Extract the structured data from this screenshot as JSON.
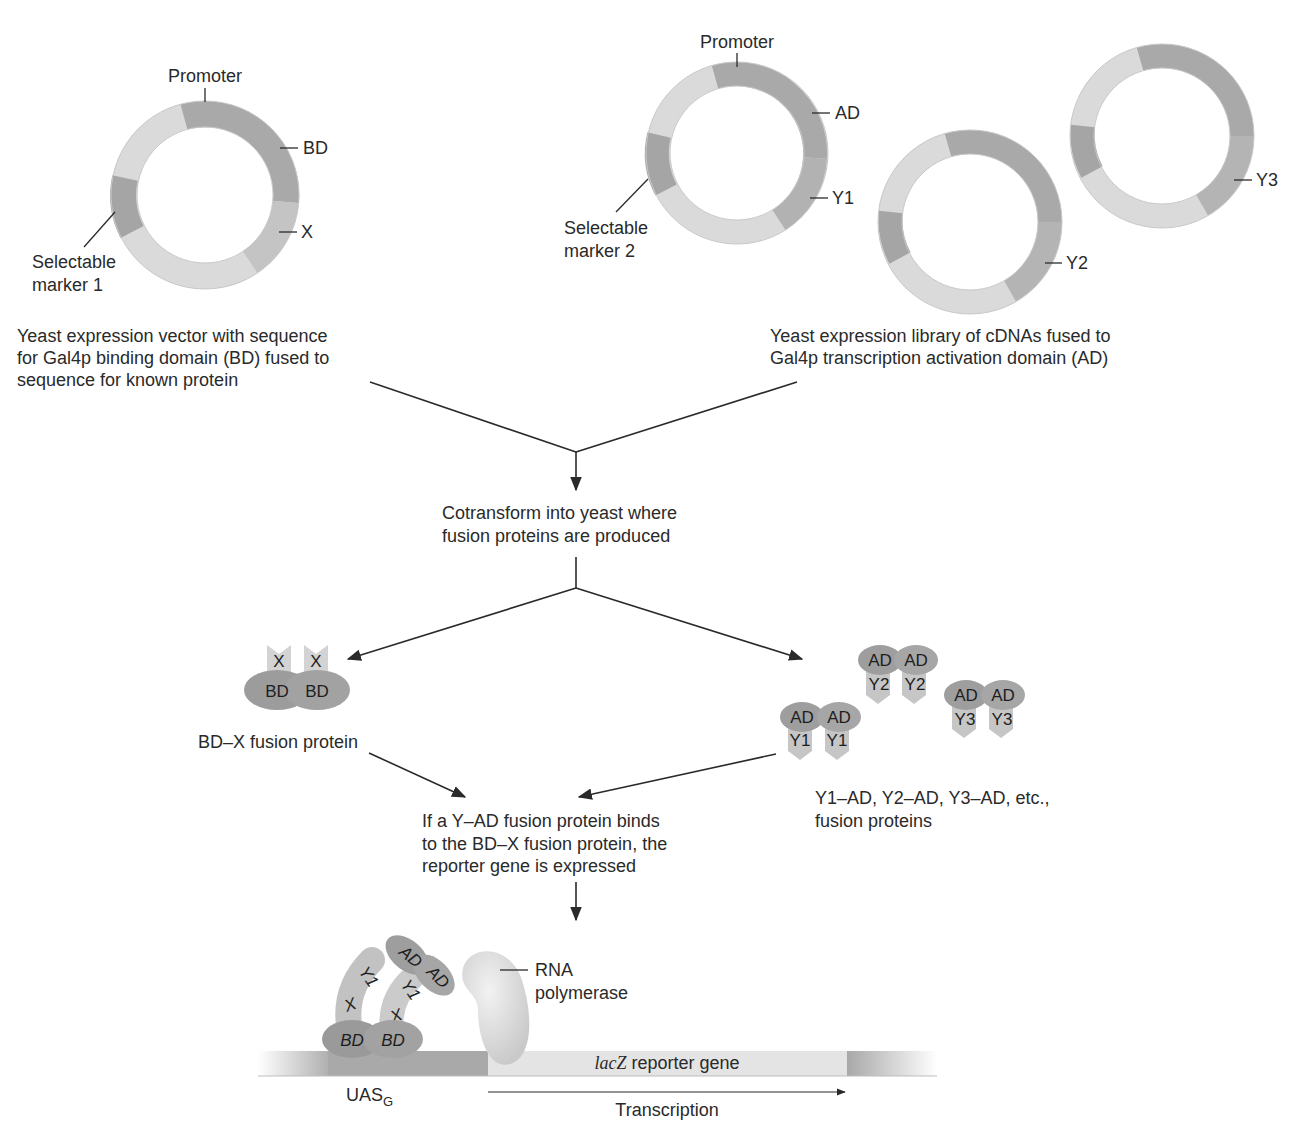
{
  "colors": {
    "ring_light": "#d9d9d9",
    "ring_dark": "#a8a8a8",
    "ring_mid": "#bdbdbd",
    "protein_dark": "#9a9a9a",
    "protein_light": "#c8c8c8",
    "dna_light": "#e2e2e2",
    "dna_dark": "#a0a0a0",
    "polymerase": "#dedede",
    "text": "#2a2a2a"
  },
  "bait_plasmid": {
    "label_promoter": "Promoter",
    "label_domain": "BD",
    "label_insert": "X",
    "label_marker_1": "Selectable",
    "label_marker_2": "marker 1",
    "caption": [
      "Yeast expression vector with sequence",
      "for Gal4p binding domain (BD) fused to",
      "sequence for known protein"
    ]
  },
  "library_plasmids": {
    "label_promoter": "Promoter",
    "label_domain": "AD",
    "label_insert_1": "Y1",
    "label_insert_2": "Y2",
    "label_insert_3": "Y3",
    "label_marker_1": "Selectable",
    "label_marker_2": "marker 2",
    "caption": [
      "Yeast expression library of cDNAs fused to",
      "Gal4p transcription activation domain (AD)"
    ]
  },
  "cotransform": {
    "caption": [
      "Cotransform into yeast where",
      "fusion proteins are produced"
    ]
  },
  "bait_protein": {
    "top_label": "X",
    "bottom_label": "BD",
    "caption": "BD–X fusion protein"
  },
  "prey_proteins": {
    "top_label": "AD",
    "pairs": [
      "Y1",
      "Y2",
      "Y3"
    ],
    "caption": [
      "Y1–AD, Y2–AD, Y3–AD, etc.,",
      "fusion proteins"
    ]
  },
  "binding": {
    "caption": [
      "If a Y–AD fusion protein binds",
      "to the BD–X fusion protein, the",
      "reporter gene is expressed"
    ]
  },
  "reporter": {
    "complex_labels": {
      "ad": "AD",
      "y": "Y1",
      "x": "X",
      "bd": "BD"
    },
    "polymerase_label_1": "RNA",
    "polymerase_label_2": "polymerase",
    "gene_italic": "lacZ",
    "gene_rest": " reporter gene",
    "uas_main": "UAS",
    "uas_sub": "G",
    "transcription": "Transcription"
  }
}
